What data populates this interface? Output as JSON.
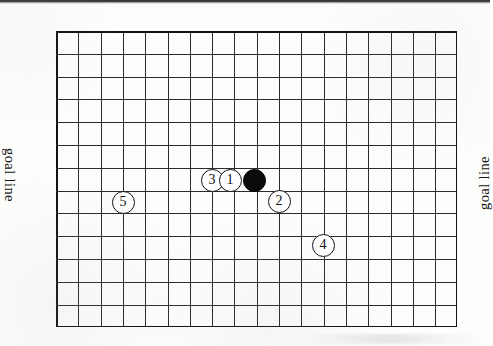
{
  "diagram": {
    "type": "go-board-diagram",
    "board": {
      "columns": 18,
      "rows": 13,
      "cell_width": 22.3,
      "cell_height": 22.8,
      "origin_x": 56,
      "origin_y": 31,
      "line_color": "#2b2b2b",
      "border_color": "#111111",
      "background_color": "#ffffff"
    },
    "labels": {
      "goal_line_left": "goal line",
      "goal_line_right": "goal line"
    },
    "stones": [
      {
        "id": "stone-3",
        "label": "3",
        "color": "white",
        "col": 7.0,
        "row": 6.55,
        "x": 212,
        "y": 180
      },
      {
        "id": "stone-1",
        "label": "1",
        "color": "white",
        "col": 7.8,
        "row": 6.55,
        "x": 230,
        "y": 180
      },
      {
        "id": "stone-black",
        "label": "",
        "color": "black",
        "col": 8.9,
        "row": 6.55,
        "x": 254,
        "y": 180
      },
      {
        "id": "stone-2",
        "label": "2",
        "color": "white",
        "col": 10.0,
        "row": 7.45,
        "x": 279,
        "y": 201
      },
      {
        "id": "stone-5",
        "label": "5",
        "color": "white",
        "col": 3.0,
        "row": 7.5,
        "x": 123,
        "y": 202
      },
      {
        "id": "stone-4",
        "label": "4",
        "color": "white",
        "col": 12.0,
        "row": 9.4,
        "x": 323,
        "y": 245
      }
    ]
  }
}
